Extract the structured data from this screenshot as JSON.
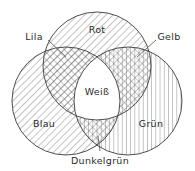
{
  "diagram": {
    "type": "venn-three-circle",
    "background_color": "#ffffff",
    "stroke_color": "#3a3a3a",
    "text_color": "#2b2b2b",
    "circles": [
      {
        "id": "rot",
        "label": "Rot",
        "hatch": "diagonal-right",
        "cx": 97,
        "cy": 66,
        "r": 54,
        "label_x": 97,
        "label_y": 30
      },
      {
        "id": "blau",
        "label": "Blau",
        "hatch": "diagonal-right",
        "cx": 66,
        "cy": 101,
        "r": 54,
        "label_x": 44,
        "label_y": 124
      },
      {
        "id": "gruen",
        "label": "Grün",
        "hatch": "vertical",
        "cx": 128,
        "cy": 101,
        "r": 54,
        "label_x": 151,
        "label_y": 124
      }
    ],
    "intersections": [
      {
        "id": "lila",
        "label": "Lila",
        "description": "Rot und Blau",
        "hatch": "cross-diagonal",
        "label_x": 34,
        "label_y": 37,
        "leader_from_x": 48,
        "leader_from_y": 40,
        "leader_to_x": 66,
        "leader_to_y": 57
      },
      {
        "id": "gelb",
        "label": "Gelb",
        "hatch": "diagonal-plus-vertical",
        "description": "Rot und Grün",
        "label_x": 169,
        "label_y": 37,
        "leader_from_x": 156,
        "leader_from_y": 40,
        "leader_to_x": 137,
        "leader_to_y": 57
      },
      {
        "id": "dunkelgruen",
        "label": "Dunkelgrün",
        "hatch": "diagonal-plus-vertical",
        "description": "Blau und Grün",
        "label_x": 100,
        "label_y": 161,
        "leader_from_x": 100,
        "leader_from_y": 151,
        "leader_to_x": 98,
        "leader_to_y": 136
      },
      {
        "id": "weiss",
        "label": "Weiß",
        "hatch": "none",
        "description": "Rot, Blau und Grün",
        "label_x": 97,
        "label_y": 92,
        "leader_from_x": null,
        "leader_from_y": null,
        "leader_to_x": null,
        "leader_to_y": null
      }
    ]
  }
}
